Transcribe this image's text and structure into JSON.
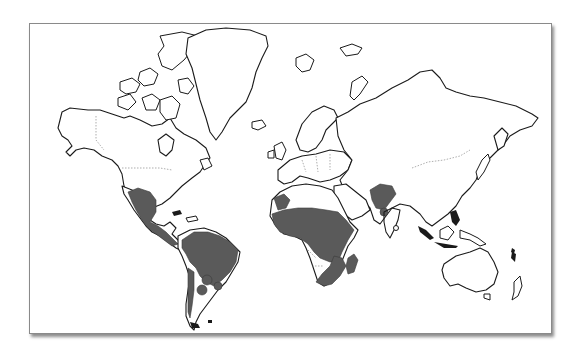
{
  "map": {
    "type": "world-map",
    "projection": "mercator-like",
    "style": "black outline continents on white with gray shaded regions",
    "colors": {
      "background": "#ffffff",
      "outline": "#1a1a1a",
      "shaded_region": "#5a5a5a",
      "frame_border": "#8a8a8a"
    },
    "shaded_regions": [
      "Mexico",
      "Central America",
      "Northern and central South America (Brazil, Amazon basin)",
      "Patches in Paraguay / northern Argentina / Uruguay",
      "Western South America (Chile coastal strip)",
      "Northwest Africa (Morocco)",
      "Sub-Saharan Africa (West, Central, East Africa)",
      "Southeastern Africa (Mozambique, South Africa east)",
      "Madagascar",
      "Northern India / Pakistan"
    ]
  }
}
